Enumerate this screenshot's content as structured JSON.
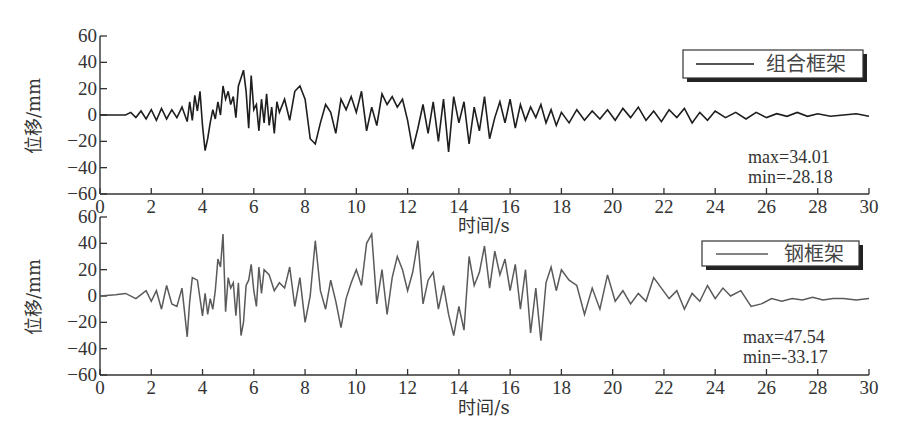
{
  "chart_data": [
    {
      "type": "line",
      "panel": "top",
      "title": "",
      "xlabel": "时间/s",
      "ylabel": "位移/mm",
      "xlim": [
        0,
        30
      ],
      "ylim": [
        -60,
        60
      ],
      "x_ticks": [
        0,
        2,
        4,
        6,
        8,
        10,
        12,
        14,
        16,
        18,
        20,
        22,
        24,
        26,
        28,
        30
      ],
      "y_ticks": [
        60,
        40,
        20,
        0,
        -20,
        -40,
        -60
      ],
      "grid": false,
      "legend": {
        "position": "upper right",
        "entries": [
          "组合框架"
        ]
      },
      "annotations": [
        "max=34.01",
        "min=-28.18"
      ],
      "series": [
        {
          "name": "组合框架",
          "color": "#1e1e1e",
          "x": [
            0,
            0.5,
            1.0,
            1.2,
            1.4,
            1.6,
            1.8,
            2.0,
            2.2,
            2.4,
            2.6,
            2.8,
            3.0,
            3.2,
            3.4,
            3.5,
            3.6,
            3.7,
            3.8,
            3.9,
            4.0,
            4.1,
            4.2,
            4.3,
            4.4,
            4.5,
            4.6,
            4.7,
            4.8,
            4.9,
            5.0,
            5.1,
            5.2,
            5.3,
            5.4,
            5.5,
            5.6,
            5.7,
            5.8,
            5.9,
            6.0,
            6.1,
            6.2,
            6.3,
            6.4,
            6.5,
            6.6,
            6.7,
            6.8,
            6.9,
            7.0,
            7.2,
            7.4,
            7.6,
            7.8,
            8.0,
            8.2,
            8.4,
            8.6,
            8.8,
            9.0,
            9.2,
            9.4,
            9.6,
            9.8,
            10.0,
            10.2,
            10.4,
            10.6,
            10.8,
            11.0,
            11.2,
            11.4,
            11.6,
            11.8,
            12.0,
            12.2,
            12.4,
            12.6,
            12.8,
            13.0,
            13.2,
            13.4,
            13.6,
            13.8,
            14.0,
            14.2,
            14.4,
            14.6,
            14.8,
            15.0,
            15.2,
            15.4,
            15.6,
            15.8,
            16.0,
            16.2,
            16.4,
            16.6,
            16.8,
            17.0,
            17.2,
            17.4,
            17.6,
            17.8,
            18.0,
            18.3,
            18.6,
            18.9,
            19.2,
            19.5,
            19.8,
            20.1,
            20.4,
            20.7,
            21.0,
            21.3,
            21.6,
            21.9,
            22.2,
            22.5,
            22.8,
            23.1,
            23.4,
            23.7,
            24.0,
            24.4,
            24.8,
            25.2,
            25.6,
            26.0,
            26.4,
            26.8,
            27.2,
            27.6,
            28.0,
            28.5,
            29.0,
            29.5,
            30.0
          ],
          "y": [
            0,
            0,
            0,
            2,
            -2,
            3,
            -3,
            4,
            -4,
            5,
            -3,
            4,
            -2,
            6,
            -5,
            10,
            -4,
            15,
            3,
            18,
            -8,
            -27,
            -18,
            -6,
            4,
            -3,
            10,
            0,
            22,
            12,
            18,
            8,
            14,
            -2,
            22,
            28,
            34,
            18,
            -10,
            30,
            4,
            8,
            -12,
            12,
            -6,
            16,
            -8,
            6,
            -14,
            10,
            2,
            12,
            -4,
            18,
            22,
            12,
            -18,
            -22,
            -6,
            8,
            2,
            -14,
            12,
            4,
            14,
            2,
            18,
            -12,
            6,
            -8,
            16,
            8,
            14,
            6,
            12,
            -4,
            -26,
            -10,
            8,
            -14,
            10,
            -20,
            12,
            -28,
            14,
            -6,
            10,
            -22,
            6,
            -12,
            14,
            -18,
            -2,
            10,
            -6,
            12,
            -10,
            8,
            -4,
            6,
            -2,
            8,
            -6,
            4,
            -8,
            2,
            -6,
            4,
            -4,
            3,
            -3,
            4,
            -4,
            5,
            -2,
            6,
            -4,
            3,
            -5,
            4,
            -2,
            5,
            -6,
            2,
            -4,
            3,
            -2,
            2,
            -3,
            2,
            -2,
            1,
            -1,
            2,
            -1,
            1,
            -1,
            0,
            1,
            -1,
            0
          ]
        }
      ]
    },
    {
      "type": "line",
      "panel": "bottom",
      "title": "",
      "xlabel": "时间/s",
      "ylabel": "位移/mm",
      "xlim": [
        0,
        30
      ],
      "ylim": [
        -60,
        60
      ],
      "x_ticks": [
        0,
        2,
        4,
        6,
        8,
        10,
        12,
        14,
        16,
        18,
        20,
        22,
        24,
        26,
        28,
        30
      ],
      "y_ticks": [
        60,
        40,
        20,
        0,
        -20,
        -40,
        -60
      ],
      "grid": false,
      "legend": {
        "position": "upper right",
        "entries": [
          "钢框架"
        ]
      },
      "annotations": [
        "max=47.54",
        "min=-33.17"
      ],
      "series": [
        {
          "name": "钢框架",
          "color": "#5a5a5a",
          "x": [
            0,
            0.6,
            1.0,
            1.4,
            1.8,
            2.0,
            2.2,
            2.4,
            2.6,
            2.8,
            3.0,
            3.2,
            3.4,
            3.5,
            3.6,
            3.8,
            4.0,
            4.1,
            4.2,
            4.3,
            4.4,
            4.5,
            4.6,
            4.7,
            4.8,
            4.9,
            5.0,
            5.1,
            5.2,
            5.3,
            5.4,
            5.5,
            5.6,
            5.7,
            5.8,
            5.9,
            6.0,
            6.1,
            6.2,
            6.3,
            6.4,
            6.6,
            6.8,
            7.0,
            7.2,
            7.4,
            7.6,
            7.8,
            8.0,
            8.2,
            8.4,
            8.6,
            8.8,
            9.0,
            9.2,
            9.4,
            9.6,
            9.8,
            10.0,
            10.2,
            10.4,
            10.6,
            10.8,
            11.0,
            11.2,
            11.4,
            11.6,
            11.8,
            12.0,
            12.2,
            12.4,
            12.6,
            12.8,
            13.0,
            13.2,
            13.4,
            13.6,
            13.8,
            14.0,
            14.2,
            14.4,
            14.6,
            14.8,
            15.0,
            15.2,
            15.4,
            15.6,
            15.8,
            16.0,
            16.2,
            16.4,
            16.6,
            16.8,
            17.0,
            17.2,
            17.4,
            17.6,
            17.8,
            18.0,
            18.3,
            18.6,
            18.9,
            19.2,
            19.5,
            19.8,
            20.1,
            20.4,
            20.7,
            21.0,
            21.3,
            21.6,
            21.9,
            22.2,
            22.5,
            22.8,
            23.1,
            23.4,
            23.7,
            24.0,
            24.3,
            24.6,
            25.0,
            25.4,
            25.8,
            26.2,
            26.6,
            27.0,
            27.4,
            27.8,
            28.2,
            28.6,
            29.0,
            29.5,
            30.0
          ],
          "y": [
            0,
            1,
            2,
            -2,
            4,
            -4,
            4,
            -10,
            8,
            -6,
            -8,
            6,
            -31,
            -4,
            14,
            12,
            -15,
            2,
            -14,
            -2,
            -10,
            4,
            28,
            22,
            47,
            -12,
            14,
            6,
            10,
            -15,
            10,
            -30,
            -20,
            8,
            12,
            24,
            4,
            -8,
            22,
            2,
            20,
            16,
            4,
            10,
            6,
            22,
            -8,
            14,
            -20,
            0,
            42,
            4,
            -10,
            12,
            -4,
            -24,
            -2,
            10,
            20,
            8,
            40,
            47,
            -6,
            20,
            -14,
            14,
            30,
            20,
            4,
            18,
            42,
            -6,
            12,
            18,
            -10,
            8,
            -14,
            -30,
            -8,
            -26,
            30,
            8,
            18,
            38,
            6,
            34,
            16,
            28,
            4,
            24,
            -10,
            20,
            -28,
            6,
            -34,
            10,
            22,
            4,
            20,
            12,
            8,
            -14,
            6,
            -10,
            16,
            -4,
            4,
            -6,
            2,
            -4,
            14,
            6,
            -2,
            4,
            -10,
            2,
            -4,
            8,
            -2,
            6,
            0,
            4,
            -8,
            -6,
            -2,
            -4,
            -2,
            -3,
            -1,
            -3,
            -2,
            -2,
            -3,
            -2,
            -2,
            -3,
            -2
          ]
        }
      ]
    }
  ],
  "panels": {
    "top": {
      "ylabel": "位移/mm",
      "xlabel": "时间/s",
      "legend_label": "组合框架",
      "max_text": "max=34.01",
      "min_text": "min=-28.18"
    },
    "bottom": {
      "ylabel": "位移/mm",
      "xlabel": "时间/s",
      "legend_label": "钢框架",
      "max_text": "max=47.54",
      "min_text": "min=-33.17"
    }
  }
}
